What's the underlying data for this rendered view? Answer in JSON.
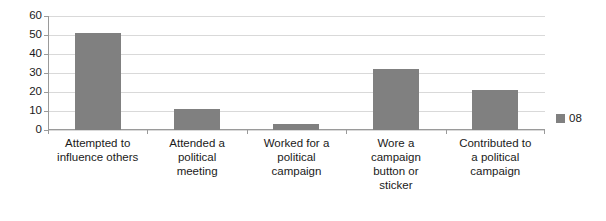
{
  "chart_data": {
    "type": "bar",
    "title": "",
    "subtitle": "",
    "xlabel": "",
    "ylabel": "",
    "ylim": [
      0,
      60
    ],
    "ytick_step": 10,
    "yticks": [
      60,
      50,
      40,
      30,
      20,
      10,
      0
    ],
    "grid": true,
    "legend_position": "right",
    "categories": [
      "Attempted to influence others",
      "Attended a political meeting",
      "Worked for a political campaign",
      "Wore a campaign button or sticker",
      "Contributed to a political campaign"
    ],
    "category_lines": [
      [
        "Attempted to",
        "influence others"
      ],
      [
        "Attended a",
        "political",
        "meeting"
      ],
      [
        "Worked for a",
        "political",
        "campaign"
      ],
      [
        "Wore a",
        "campaign",
        "button or",
        "sticker"
      ],
      [
        "Contributed to",
        "a political",
        "campaign"
      ]
    ],
    "series": [
      {
        "name": "08",
        "color": "#808080",
        "values": [
          51,
          11,
          3,
          32,
          21
        ]
      }
    ]
  },
  "legend": {
    "entries": [
      {
        "label": "08",
        "color": "#808080"
      }
    ]
  },
  "colors": {
    "bar": "#808080",
    "gridline": "#d9d9d9",
    "axis": "#9a9a9a",
    "background": "#ffffff",
    "text": "#1a1a1a"
  }
}
